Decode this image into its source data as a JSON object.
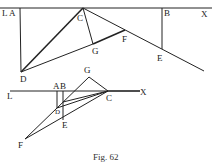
{
  "figure": {
    "caption": "Fig. 62",
    "top_diagram": {
      "labels": {
        "L": "L",
        "A": "A",
        "B": "B",
        "X": "X",
        "C": "C",
        "G": "G",
        "F": "F",
        "E": "E",
        "D": "D"
      }
    },
    "bottom_diagram": {
      "labels": {
        "L": "L",
        "A": "A",
        "B": "B",
        "X": "X",
        "C": "C",
        "G": "G",
        "D": "D",
        "E": "E",
        "F": "F"
      }
    }
  },
  "colors": {
    "ink": "#222222",
    "paper": "#ffffff"
  }
}
